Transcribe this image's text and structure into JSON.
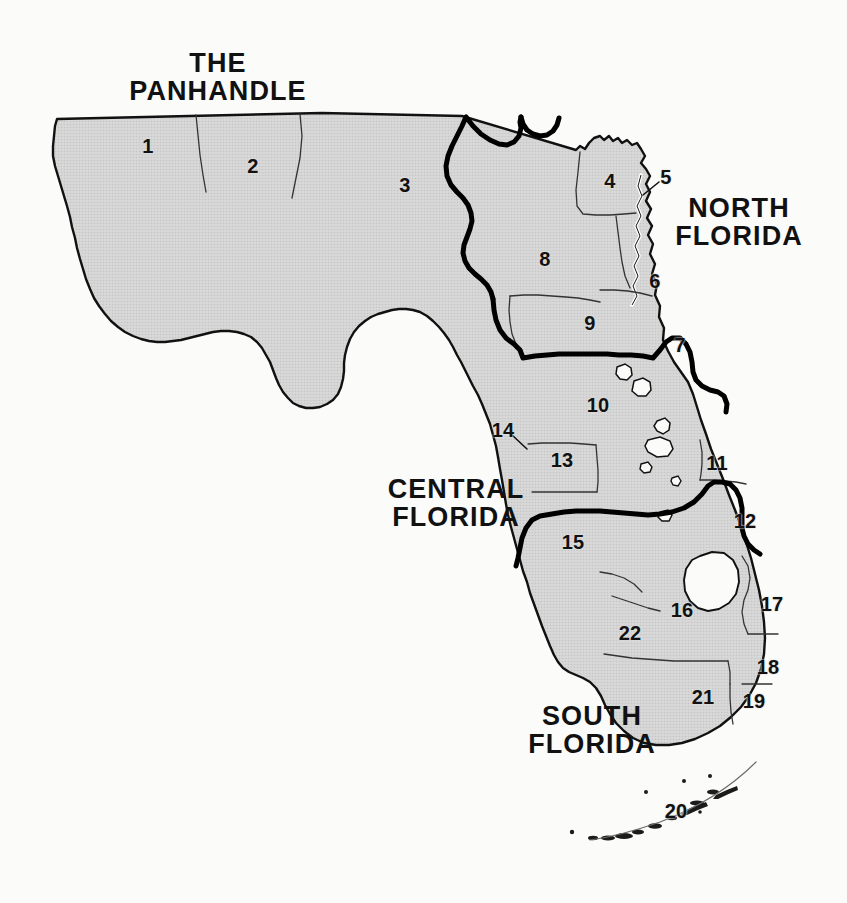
{
  "map": {
    "title": "Florida Regions Map",
    "background_color": "#fbfbfa",
    "land_fill_color": "#cfcfcf",
    "county_line_color": "#1a1a1a",
    "region_boundary_color": "#000000",
    "water_fill_color": "#fbfbfa",
    "label_color": "#111111"
  },
  "area_labels": [
    {
      "id": "panhandle",
      "lines": [
        "THE",
        "PANHANDLE"
      ],
      "x": 218,
      "y": 77
    },
    {
      "id": "north-florida",
      "lines": [
        "NORTH",
        "FLORIDA"
      ],
      "x": 739,
      "y": 222
    },
    {
      "id": "central-florida",
      "lines": [
        "CENTRAL",
        "FLORIDA"
      ],
      "x": 456,
      "y": 503
    },
    {
      "id": "south-florida",
      "lines": [
        "SOUTH",
        "FLORIDA"
      ],
      "x": 592,
      "y": 730
    }
  ],
  "region_numbers": [
    {
      "number": "1",
      "x": 148,
      "y": 146
    },
    {
      "number": "2",
      "x": 253,
      "y": 166
    },
    {
      "number": "3",
      "x": 405,
      "y": 185
    },
    {
      "number": "4",
      "x": 610,
      "y": 181
    },
    {
      "number": "5",
      "x": 666,
      "y": 177
    },
    {
      "number": "6",
      "x": 655,
      "y": 281
    },
    {
      "number": "7",
      "x": 680,
      "y": 345
    },
    {
      "number": "8",
      "x": 545,
      "y": 259
    },
    {
      "number": "9",
      "x": 590,
      "y": 323
    },
    {
      "number": "10",
      "x": 598,
      "y": 405
    },
    {
      "number": "11",
      "x": 717,
      "y": 463
    },
    {
      "number": "12",
      "x": 745,
      "y": 521
    },
    {
      "number": "13",
      "x": 562,
      "y": 460
    },
    {
      "number": "14",
      "x": 503,
      "y": 430
    },
    {
      "number": "15",
      "x": 573,
      "y": 542
    },
    {
      "number": "16",
      "x": 682,
      "y": 610
    },
    {
      "number": "17",
      "x": 772,
      "y": 604
    },
    {
      "number": "18",
      "x": 768,
      "y": 667
    },
    {
      "number": "19",
      "x": 754,
      "y": 701
    },
    {
      "number": "20",
      "x": 676,
      "y": 811
    },
    {
      "number": "21",
      "x": 703,
      "y": 697
    },
    {
      "number": "22",
      "x": 630,
      "y": 633
    }
  ],
  "leader_lines": [
    {
      "id": "leader-5",
      "from_x": 660,
      "from_y": 182,
      "to_x": 641,
      "to_y": 196
    },
    {
      "id": "leader-14",
      "from_x": 512,
      "from_y": 434,
      "to_x": 526,
      "to_y": 447
    }
  ]
}
